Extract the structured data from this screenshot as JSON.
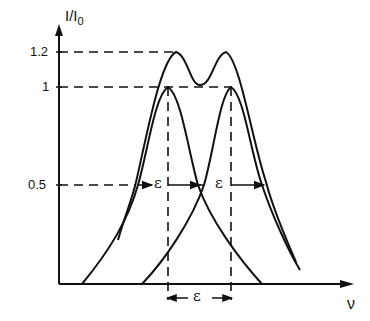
{
  "diagram": {
    "type": "spectral-line-resolution (Rayleigh-like criterion)",
    "y_axis": {
      "label": "I/I0",
      "ticks": [
        "1.2",
        "1",
        "0.5"
      ]
    },
    "x_axis": {
      "label": "ν"
    },
    "epsilon_labels": [
      "ε",
      "ε",
      "ε"
    ],
    "curves": [
      {
        "name": "line-1",
        "peak_x": "ν1",
        "peak": 1
      },
      {
        "name": "line-2",
        "peak_x": "ν2",
        "peak": 1
      },
      {
        "name": "sum",
        "peaks": 1.2,
        "dip": 1
      }
    ]
  },
  "labels": {
    "y_axis_title": "I/I",
    "y_axis_sub": "0",
    "tick_12": "1.2",
    "tick_1": "1",
    "tick_05": "0.5",
    "x_axis_title": "ν",
    "eps_left": "ε",
    "eps_right": "ε",
    "eps_bottom": "ε"
  },
  "colors": {
    "ink": "#111111",
    "background": "#ffffff"
  }
}
